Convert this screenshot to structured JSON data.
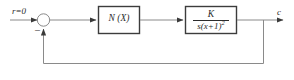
{
  "diagram": {
    "type": "control-system-block-diagram",
    "stroke_color": "#8a8a8a",
    "block_border_color": "#3c3c3c",
    "text_color": "#2b2b2b",
    "background_color": "#ffffff",
    "input": {
      "label": "r=0"
    },
    "summing_junction": {
      "name": "summing-junction",
      "feedback_sign": "–"
    },
    "blocks": [
      {
        "id": "nonlinearity",
        "label": "N (X)"
      },
      {
        "id": "plant",
        "numerator": "K",
        "denominator_base": "s(x+1)",
        "denominator_exponent": "2"
      }
    ],
    "output": {
      "label": "c"
    }
  }
}
